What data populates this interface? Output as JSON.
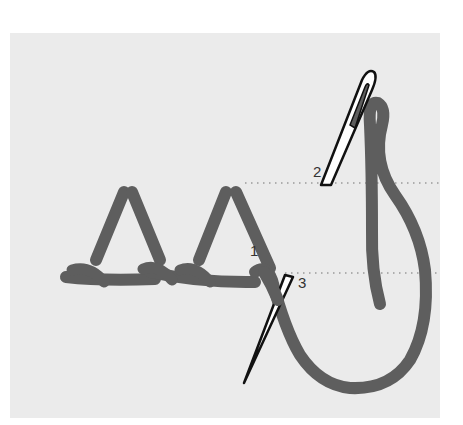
{
  "diagram": {
    "type": "embroidery-stitch-instruction",
    "colors": {
      "background": "#ffffff",
      "fabric": "#ebebeb",
      "thread": "#5e5e5e",
      "needle_fill": "#ffffff",
      "needle_outline": "#111111",
      "guide_line": "#9a9a9a",
      "label": "#333333"
    },
    "labels": {
      "point1": "1",
      "point2": "2",
      "point3": "3"
    },
    "guide_lines": [
      {
        "name": "upper-guide",
        "y": 183
      },
      {
        "name": "lower-guide",
        "y": 273
      }
    ],
    "elements": [
      "completed-stitch-1",
      "completed-stitch-2",
      "needle-upper",
      "needle-lower",
      "working-thread"
    ]
  }
}
